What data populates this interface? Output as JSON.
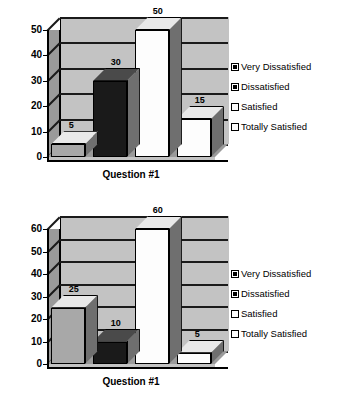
{
  "page": {
    "background": "#ffffff",
    "width": 341,
    "height": 407
  },
  "palette": {
    "very_dissatisfied": "#a8a8a8",
    "dissatisfied": "#1a1a1a",
    "satisfied": "#fdfdfd",
    "totally_satisfied": "#fdfdfd",
    "back_wall": "#c3c3c3",
    "side_wall": "#9a9a9a",
    "gridline": "#1a1a1a",
    "axis": "#000000",
    "text": "#000000"
  },
  "legend": {
    "position": "right",
    "items": [
      {
        "label": "Very Dissatisfied",
        "color": "#a8a8a8",
        "swatch": "gray-swatch"
      },
      {
        "label": "Dissatisfied",
        "color": "#1a1a1a",
        "swatch": "black-swatch"
      },
      {
        "label": "Satisfied",
        "color": "#fdfdfd",
        "swatch": "white-swatch"
      },
      {
        "label": "Totally Satisfied",
        "color": "#fdfdfd",
        "swatch": "white-swatch"
      }
    ]
  },
  "chart_data": [
    {
      "id": "chart-1",
      "type": "bar",
      "title": "",
      "xlabel": "Question #1",
      "ylabel": "",
      "categories": [
        "Very Dissatisfied",
        "Dissatisfied",
        "Satisfied",
        "Totally Satisfied"
      ],
      "values": [
        5,
        30,
        50,
        15
      ],
      "data_labels": [
        "5",
        "30",
        "50",
        "15"
      ],
      "colors": [
        "#a8a8a8",
        "#1a1a1a",
        "#fdfdfd",
        "#fdfdfd"
      ],
      "ylim": [
        0,
        50
      ],
      "ytick_step": 10,
      "yticks": [
        "0",
        "10",
        "20",
        "30",
        "40",
        "50"
      ],
      "grid": true,
      "three_d": true
    },
    {
      "id": "chart-2",
      "type": "bar",
      "title": "",
      "xlabel": "Question #1",
      "ylabel": "",
      "categories": [
        "Very Dissatisfied",
        "Dissatisfied",
        "Satisfied",
        "Totally Satisfied"
      ],
      "values": [
        25,
        10,
        60,
        5
      ],
      "data_labels": [
        "25",
        "10",
        "60",
        "5"
      ],
      "colors": [
        "#a8a8a8",
        "#1a1a1a",
        "#fdfdfd",
        "#fdfdfd"
      ],
      "ylim": [
        0,
        60
      ],
      "ytick_step": 10,
      "yticks": [
        "0",
        "10",
        "20",
        "30",
        "40",
        "50",
        "60"
      ],
      "grid": true,
      "three_d": true
    }
  ]
}
